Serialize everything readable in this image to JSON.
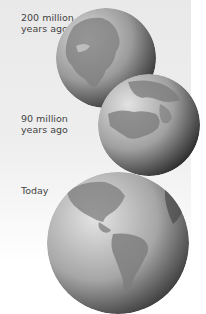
{
  "stages": [
    {
      "label_line1": "200 million",
      "label_line2": "years ago",
      "name": "globe-200-million-years-ago"
    },
    {
      "label_line1": "90 million",
      "label_line2": "years ago",
      "name": "globe-90-million-years-ago"
    },
    {
      "label_line1": "Today",
      "label_line2": "",
      "name": "globe-today"
    }
  ],
  "colors": {
    "background_top": "#e9e9e9",
    "background_bottom": "#ffffff",
    "text": "#444444",
    "ocean_light": "#d0d0d0",
    "ocean_dark": "#2e2e2e",
    "land": "#8a8a8a"
  }
}
